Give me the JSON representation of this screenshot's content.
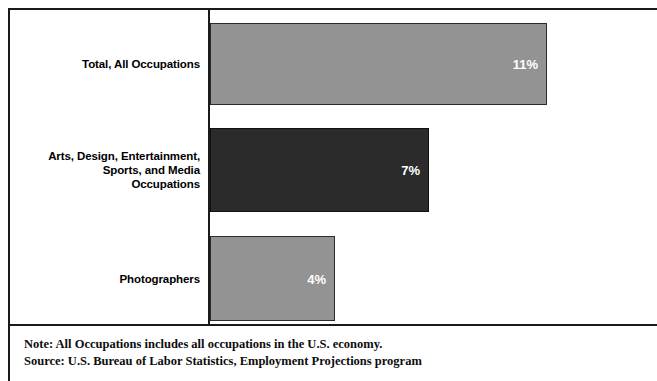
{
  "chart_data": {
    "type": "bar",
    "orientation": "horizontal",
    "title": "",
    "subtitle": "",
    "xlabel": "",
    "ylabel": "",
    "grid": false,
    "legend": null,
    "axis_line": "vertical category axis at left of bars",
    "xlim": [
      0,
      13
    ],
    "categories": [
      "Total, All Occupations",
      "Arts, Design, Entertainment, Sports, and Media Occupations",
      "Photographers"
    ],
    "values": [
      11,
      7,
      4
    ],
    "value_labels": [
      "11%",
      "7%",
      "4%"
    ],
    "bar_colors": [
      "#939393",
      "#2b2b2b",
      "#939393"
    ],
    "value_label_color": "#ffffff"
  },
  "chart": {
    "bars": [
      {
        "label_lines": [
          "Total, All Occupations"
        ],
        "value_label": "11%",
        "value": 11,
        "style": "gray",
        "top": 13,
        "height": 82,
        "width": 337
      },
      {
        "label_lines": [
          "Arts, Design, Entertainment,",
          "Sports, and Media",
          "Occupations"
        ],
        "value_label": "7%",
        "value": 7,
        "style": "dark",
        "top": 118,
        "height": 84,
        "width": 219
      },
      {
        "label_lines": [
          "Photographers"
        ],
        "value_label": "4%",
        "value": 4,
        "style": "gray",
        "top": 226,
        "height": 85,
        "width": 125
      }
    ]
  },
  "footnotes": {
    "note": "Note: All Occupations includes all occupations in the U.S. economy.",
    "source": "Source: U.S. Bureau of Labor Statistics, Employment Projections program"
  },
  "colors": {
    "bar_gray": "#939393",
    "bar_dark": "#2b2b2b",
    "frame": "#1a1a1a",
    "text": "#000000",
    "value_text": "#ffffff",
    "background": "#ffffff"
  }
}
